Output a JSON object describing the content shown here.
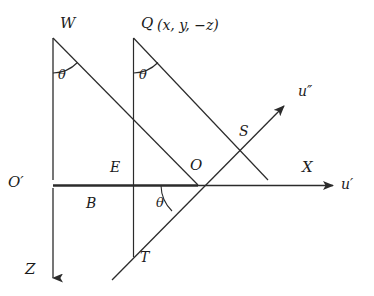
{
  "figure": {
    "type": "geometry-diagram",
    "background_color": "#ffffff",
    "stroke_color": "#2b2b2b",
    "label_color": "#1b1b1b",
    "width": 374,
    "height": 296,
    "points": {
      "W": {
        "label": "W",
        "x": 53,
        "y": 38
      },
      "Q": {
        "label": "Q",
        "x": 134,
        "y": 38
      },
      "Q_coords": {
        "label": "Q (x, y, −z)",
        "x": 134,
        "y": 38
      },
      "O_prime": {
        "label": "O′",
        "x": 53,
        "y": 185
      },
      "E": {
        "label": "E",
        "x": 134,
        "y": 185
      },
      "B": {
        "label": "B",
        "x": 100,
        "y": 205
      },
      "O": {
        "label": "O",
        "x": 198,
        "y": 185
      },
      "S": {
        "label": "S",
        "x": 247,
        "y": 133
      },
      "T": {
        "label": "T",
        "x": 133,
        "y": 257
      }
    },
    "axes": {
      "x_axis": {
        "label": "X",
        "secondary_label": "u′",
        "direction": "right",
        "y": 185
      },
      "z_axis": {
        "label": "Z",
        "direction": "down",
        "x": 53
      },
      "u_double_prime_axis": {
        "label": "u″",
        "direction": "up-right"
      }
    },
    "angles": [
      {
        "label": "θ",
        "at": "W",
        "x": 63,
        "y": 72
      },
      {
        "label": "θ",
        "at": "Q",
        "x": 144,
        "y": 72
      },
      {
        "label": "θ",
        "at": "O",
        "x": 160,
        "y": 200
      }
    ],
    "labels": {
      "W": "W",
      "Q": "Q",
      "Q_coordinates": "(x, y, −z)",
      "O_prime": "O′",
      "E": "E",
      "B": "B",
      "O": "O",
      "S": "S",
      "T": "T",
      "X": "X",
      "Z": "Z",
      "u_prime": "u′",
      "u_double_prime": "u″",
      "theta": "θ"
    }
  }
}
